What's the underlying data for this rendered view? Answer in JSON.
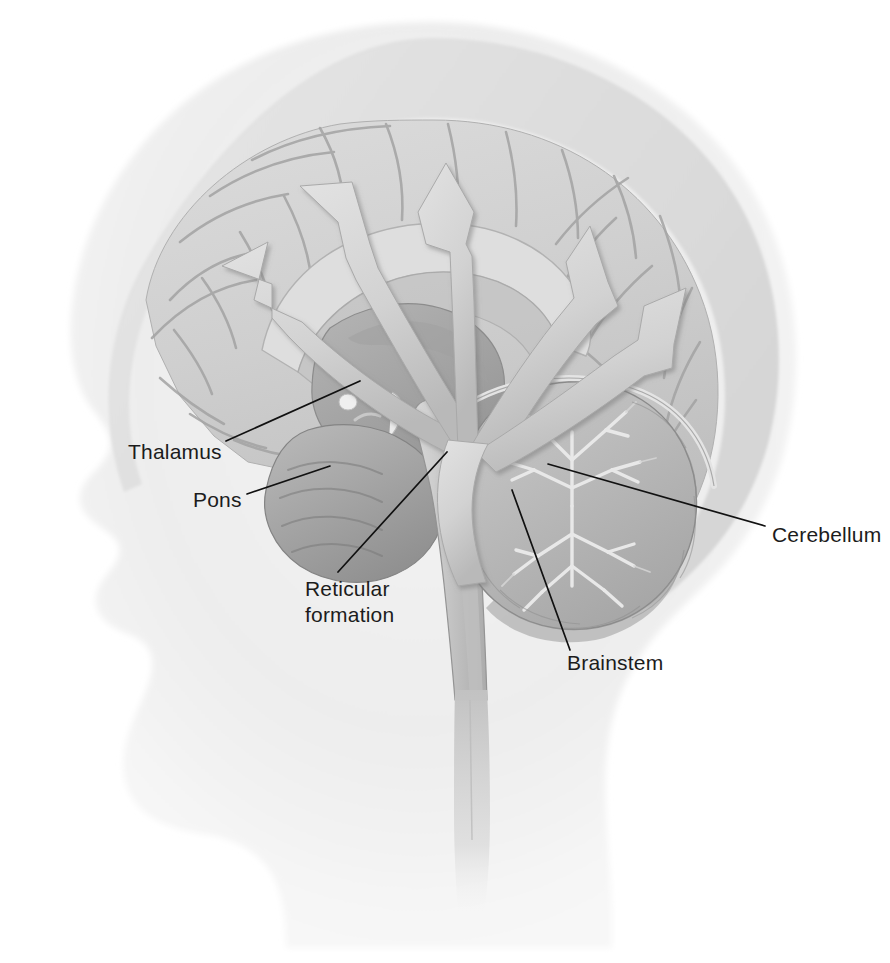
{
  "figure": {
    "background_color": "#ffffff",
    "head_silhouette_color": "#efefef",
    "brain_color": "#cdcdcd",
    "arrow_color": "#d4d4d4",
    "leader_line_color": "#111111",
    "label_color": "#1c1c1c"
  },
  "labels": [
    {
      "id": "thalamus",
      "text": "Thalamus",
      "x": 128,
      "y": 459,
      "anchor": "start",
      "leader": "M 226 441 L 360 381"
    },
    {
      "id": "pons",
      "text": "Pons",
      "x": 193,
      "y": 507,
      "anchor": "start",
      "leader": "M 247 494 L 330 466"
    },
    {
      "id": "reticular-formation",
      "text": "Reticular",
      "text2": "formation",
      "x": 305,
      "y": 596,
      "y2": 622,
      "anchor": "start",
      "leader": "M 338 572 L 447 452"
    },
    {
      "id": "cerebellum",
      "text": "Cerebellum",
      "x": 772,
      "y": 542,
      "anchor": "start",
      "leader": "M 765 526 L 548 464"
    },
    {
      "id": "brainstem",
      "text": "Brainstem",
      "x": 567,
      "y": 670,
      "anchor": "start",
      "leader": "M 570 650 L 512 490"
    }
  ],
  "arrows": [
    {
      "id": "arrow-to-frontal-lateral",
      "direction": "upper-left-shallow",
      "target_lobe": "frontal"
    },
    {
      "id": "arrow-to-frontal-superior",
      "direction": "upper-left-steep",
      "target_lobe": "frontal"
    },
    {
      "id": "arrow-to-vertex",
      "direction": "up",
      "target_lobe": "parietal"
    },
    {
      "id": "arrow-to-parietal",
      "direction": "upper-right",
      "target_lobe": "parietal"
    },
    {
      "id": "arrow-to-occipital",
      "direction": "right",
      "target_lobe": "occipital"
    }
  ],
  "structures": [
    {
      "id": "cerebral-cortex",
      "name": "Cerebral cortex"
    },
    {
      "id": "corpus-callosum",
      "name": "Corpus callosum"
    },
    {
      "id": "thalamus-body",
      "name": "Thalamus"
    },
    {
      "id": "pituitary",
      "name": "Pituitary gland"
    },
    {
      "id": "pons-body",
      "name": "Pons"
    },
    {
      "id": "cerebellum-body",
      "name": "Cerebellum"
    },
    {
      "id": "medulla-spinal-cord",
      "name": "Medulla and spinal cord"
    }
  ]
}
